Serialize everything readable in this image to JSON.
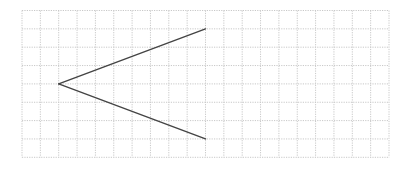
{
  "diagram": {
    "type": "angle-on-grid",
    "background_color": "#ffffff",
    "grid": {
      "origin_x": 22,
      "origin_y": 10.5,
      "cell_size": 18.35,
      "columns": 20,
      "rows": 8,
      "line_color": "#c8c8c8",
      "line_style": "dotted"
    },
    "angle": {
      "stroke_color": "#444444",
      "stroke_width": 1.4,
      "vertex": {
        "col": 2,
        "row": 4
      },
      "ray_ends": [
        {
          "col": 10,
          "row": 1
        },
        {
          "col": 10,
          "row": 7
        }
      ]
    }
  }
}
